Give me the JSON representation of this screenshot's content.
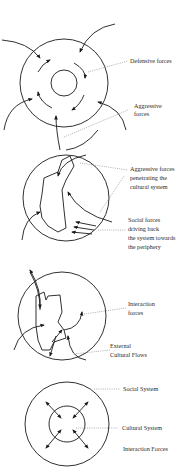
{
  "diagram": {
    "panels": [
      {
        "id": "panel-1",
        "labels": [
          "Defensive forces",
          "Aggressive",
          "forces"
        ]
      },
      {
        "id": "panel-2",
        "labels": [
          "Aggressive forces",
          "penetrating the",
          "cultural system",
          "Social forces",
          "driving back",
          "the system towards",
          "the periphery"
        ]
      },
      {
        "id": "panel-3",
        "labels": [
          "Interaction",
          "forces",
          "External",
          "Cultural Flows"
        ]
      },
      {
        "id": "panel-4",
        "labels": [
          "Social System",
          "Cultural System",
          "Interaction Forces"
        ]
      }
    ],
    "colors": {
      "line": "#1a1a1a",
      "leader": "#777777",
      "background": "#ffffff"
    }
  }
}
